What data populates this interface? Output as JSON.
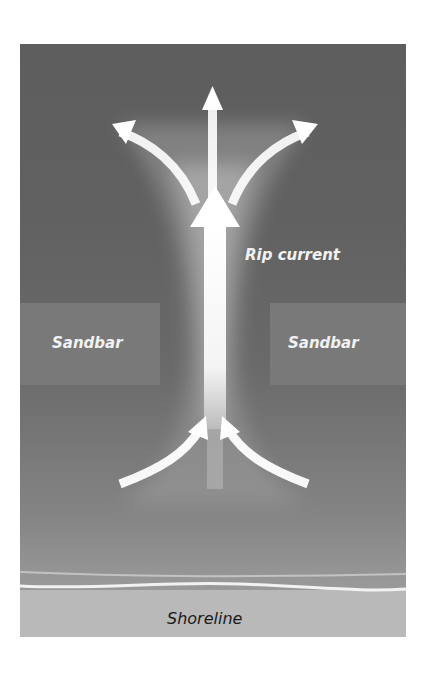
{
  "diagram": {
    "labels": {
      "rip_current": "Rip current",
      "sandbar_left": "Sandbar",
      "sandbar_right": "Sandbar",
      "shoreline": "Shoreline"
    },
    "colors": {
      "deep_water": "#5e5e5e",
      "sandbar": "#7a7a7a",
      "shallow_water": "#9a9a9a",
      "sand": "#b9b9b9",
      "arrow": "#ffffff"
    },
    "arrows": [
      {
        "name": "main-outflow",
        "direction": "up"
      },
      {
        "name": "top-center",
        "direction": "up"
      },
      {
        "name": "top-left",
        "direction": "up-left"
      },
      {
        "name": "top-right",
        "direction": "up-right"
      },
      {
        "name": "feeder-left",
        "direction": "up-right"
      },
      {
        "name": "feeder-right",
        "direction": "up-left"
      }
    ]
  }
}
